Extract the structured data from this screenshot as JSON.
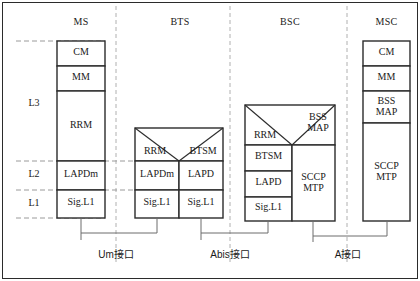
{
  "diagram": {
    "frame_color": "#2b2b2b",
    "dash_color": "#9a9a9a",
    "connector_color": "#6d6d6d"
  },
  "column_titles": [
    {
      "id": "ms",
      "label": "MS"
    },
    {
      "id": "bts",
      "label": "BTS"
    },
    {
      "id": "bsc",
      "label": "BSC"
    },
    {
      "id": "msc",
      "label": "MSC"
    }
  ],
  "layer_labels": [
    {
      "id": "l3",
      "label": "L3"
    },
    {
      "id": "l2",
      "label": "L2"
    },
    {
      "id": "l1",
      "label": "L1"
    }
  ],
  "ms_stack": [
    {
      "id": "ms-cm",
      "label": "CM"
    },
    {
      "id": "ms-mm",
      "label": "MM"
    },
    {
      "id": "ms-rrm",
      "label": "RRM"
    },
    {
      "id": "ms-lapdm",
      "label": "LAPDm"
    },
    {
      "id": "ms-sigl1",
      "label": "Sig.L1"
    }
  ],
  "bts_stack": [
    {
      "id": "bts-rrm",
      "label": "RRM"
    },
    {
      "id": "bts-btsm",
      "label": "BTSM"
    },
    {
      "id": "bts-lapdm",
      "label": "LAPDm"
    },
    {
      "id": "bts-lapd",
      "label": "LAPD"
    },
    {
      "id": "bts-sigl1-l",
      "label": "Sig.L1"
    },
    {
      "id": "bts-sigl1-r",
      "label": "Sig.L1"
    }
  ],
  "bsc_stack": [
    {
      "id": "bsc-rrm",
      "label": "RRM"
    },
    {
      "id": "bsc-bssmap",
      "label": "BSS\nMAP"
    },
    {
      "id": "bsc-btsm",
      "label": "BTSM"
    },
    {
      "id": "bsc-lapd",
      "label": "LAPD"
    },
    {
      "id": "bsc-sigl1",
      "label": "Sig.L1"
    },
    {
      "id": "bsc-sccpmtp",
      "label": "SCCP\nMTP"
    }
  ],
  "msc_stack": [
    {
      "id": "msc-cm",
      "label": "CM"
    },
    {
      "id": "msc-mm",
      "label": "MM"
    },
    {
      "id": "msc-bssmap",
      "label": "BSS\nMAP"
    },
    {
      "id": "msc-sccpmtp",
      "label": "SCCP\nMTP"
    }
  ],
  "interfaces": [
    {
      "id": "um",
      "label": "Um接口"
    },
    {
      "id": "abis",
      "label": "Abis接口"
    },
    {
      "id": "a",
      "label": "A接口"
    }
  ]
}
